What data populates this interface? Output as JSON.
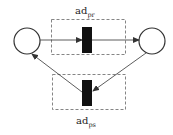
{
  "diagram": {
    "type": "petri-net",
    "places": [
      {
        "id": "p-left",
        "cx": 27,
        "cy": 41,
        "r": 13
      },
      {
        "id": "p-right",
        "cx": 152,
        "cy": 41,
        "r": 13
      }
    ],
    "transitions": [
      {
        "id": "t-top",
        "x": 82,
        "y": 26,
        "w": 10,
        "h": 26
      },
      {
        "id": "t-bottom",
        "x": 82,
        "y": 80,
        "w": 10,
        "h": 26
      }
    ],
    "groups": {
      "top": {
        "label": "ad",
        "subscript": "pr",
        "x": 51,
        "y": 19,
        "w": 74,
        "h": 35
      },
      "bottom": {
        "label": "ad",
        "subscript": "ps",
        "x": 52,
        "y": 74,
        "w": 73,
        "h": 35
      }
    },
    "colors": {
      "stroke": "#333333",
      "transition_fill": "#111111",
      "dash": "#666666"
    }
  }
}
